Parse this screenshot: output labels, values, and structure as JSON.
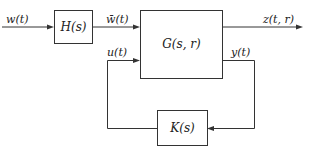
{
  "diagram": {
    "type": "feedback-block-diagram",
    "colors": {
      "line": "#333333",
      "text": "#222222",
      "background": "#ffffff"
    },
    "blocks": {
      "H": {
        "label": "H(s)"
      },
      "G": {
        "label": "G(s, r)"
      },
      "K": {
        "label": "K(s)"
      }
    },
    "signals": {
      "w": "w(t)",
      "w_bar": "w̄(t)",
      "z": "z(t, r)",
      "u": "u(t)",
      "y": "y(t)"
    },
    "connections": [
      {
        "from": "input",
        "to": "H",
        "signal": "w(t)"
      },
      {
        "from": "H",
        "to": "G",
        "signal": "w̄(t)"
      },
      {
        "from": "G",
        "to": "output",
        "signal": "z(t, r)"
      },
      {
        "from": "G",
        "to": "K",
        "signal": "y(t)"
      },
      {
        "from": "K",
        "to": "G",
        "signal": "u(t)"
      }
    ]
  }
}
